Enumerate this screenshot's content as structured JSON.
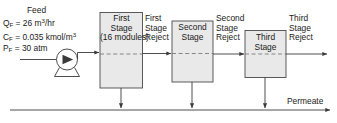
{
  "diagram": {
    "feed": {
      "title": "Feed",
      "flowrate": {
        "symbol": "Q",
        "subscript": "F",
        "value": "26",
        "unit": "m",
        "unit_exp": "3",
        "unit_tail": "/hr"
      },
      "concentration": {
        "symbol": "C",
        "subscript": "F",
        "value": "0.035",
        "unit": "kmol/m",
        "unit_exp": "3"
      },
      "pressure": {
        "symbol": "P",
        "subscript": "F",
        "value": "30",
        "unit": "atm"
      }
    },
    "pump": {
      "name": "feed-pump"
    },
    "stages": [
      {
        "id": "first-stage",
        "line1": "First",
        "line2": "Stage",
        "line3": "(16 modules)",
        "reject": "First\nStage\nReject"
      },
      {
        "id": "second-stage",
        "line1": "Second",
        "line2": "Stage",
        "line3": "",
        "reject": "Second\nStage\nReject"
      },
      {
        "id": "third-stage",
        "line1": "Third",
        "line2": "Stage",
        "line3": "",
        "reject": "Third\nStage\nReject"
      }
    ],
    "reject_labels": [
      {
        "l1": "First",
        "l2": "Stage",
        "l3": "Reject"
      },
      {
        "l1": "Second",
        "l2": "Stage",
        "l3": "Reject"
      },
      {
        "l1": "Third",
        "l2": "Stage",
        "l3": "Reject"
      }
    ],
    "permeate": {
      "label": "Permeate"
    },
    "colors": {
      "line": "#3a3a3a",
      "box_fill": "#e9e9e9",
      "box_stroke": "#4a4a4a",
      "dashed": "#7a7a7a",
      "text": "#1a1a1a",
      "background": "#ffffff"
    }
  }
}
